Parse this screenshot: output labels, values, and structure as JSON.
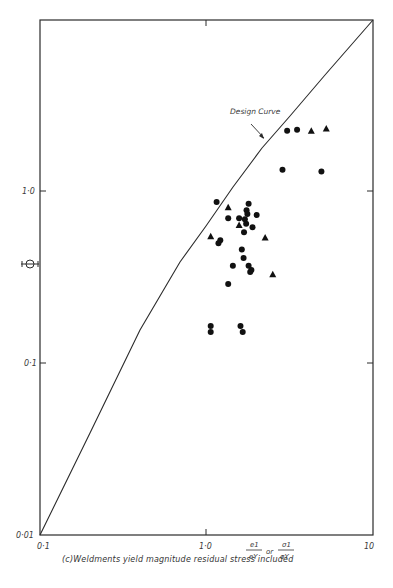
{
  "chart_data": {
    "type": "scatter",
    "title": "",
    "caption": "(c) Weldments yield magnitude residual stress included",
    "xlabel": "e1/eY or σ1/σY",
    "ylabel": "Φ",
    "xscale": "log",
    "yscale": "log",
    "xlim": [
      0.1,
      10
    ],
    "ylim": [
      0.01,
      10
    ],
    "x_ticks": [
      "0·1",
      "1·0",
      "10"
    ],
    "y_ticks": [
      "0·01",
      "0·1",
      "1·0"
    ],
    "grid": false,
    "annotations": [
      {
        "text": "Design Curve",
        "arrow_to": [
          1.72,
          1.7
        ]
      }
    ],
    "series": [
      {
        "name": "Design Curve",
        "kind": "line",
        "points": [
          [
            0.1,
            0.01
          ],
          [
            0.2,
            0.04
          ],
          [
            0.4,
            0.16
          ],
          [
            0.7,
            0.42
          ],
          [
            1.0,
            0.72
          ],
          [
            1.5,
            1.25
          ],
          [
            2.0,
            1.9
          ],
          [
            3.0,
            3.0
          ],
          [
            5.0,
            5.5
          ],
          [
            10,
            10
          ]
        ]
      },
      {
        "name": "circle-markers",
        "kind": "scatter",
        "marker": "circle",
        "points": [
          [
            3.05,
            2.26
          ],
          [
            3.5,
            2.29
          ],
          [
            2.86,
            1.34
          ],
          [
            4.9,
            1.31
          ],
          [
            1.15,
            0.87
          ],
          [
            1.35,
            0.7
          ],
          [
            1.57,
            0.7
          ],
          [
            1.74,
            0.78
          ],
          [
            1.79,
            0.85
          ],
          [
            1.76,
            0.74
          ],
          [
            1.7,
            0.69
          ],
          [
            1.89,
            0.62
          ],
          [
            1.73,
            0.65
          ],
          [
            1.68,
            0.58
          ],
          [
            2.0,
            0.73
          ],
          [
            1.18,
            0.5
          ],
          [
            1.21,
            0.52
          ],
          [
            1.63,
            0.46
          ],
          [
            1.67,
            0.41
          ],
          [
            1.79,
            0.37
          ],
          [
            1.44,
            0.37
          ],
          [
            1.35,
            0.29
          ],
          [
            1.86,
            0.35
          ],
          [
            1.83,
            0.34
          ],
          [
            1.06,
            0.165
          ],
          [
            1.06,
            0.152
          ],
          [
            1.6,
            0.165
          ],
          [
            1.65,
            0.152
          ]
        ]
      },
      {
        "name": "triangle-markers",
        "kind": "scatter",
        "marker": "triangle",
        "points": [
          [
            4.26,
            2.26
          ],
          [
            5.24,
            2.33
          ],
          [
            1.35,
            0.81
          ],
          [
            1.57,
            0.64
          ],
          [
            1.06,
            0.55
          ],
          [
            2.25,
            0.54
          ],
          [
            2.5,
            0.33
          ]
        ]
      }
    ]
  },
  "labels": {
    "design_curve": "Design Curve",
    "y_symbol": "Φ",
    "x_tick_0": "0·1",
    "x_tick_1": "1·0",
    "x_tick_2": "10",
    "y_tick_0": "0·01",
    "y_tick_1": "0·1",
    "y_tick_2": "1·0",
    "xlabel_num1": "e1",
    "xlabel_den1": "eY",
    "xlabel_or": "or",
    "xlabel_num2": "σ1",
    "xlabel_den2": "σY",
    "caption": "(c)Weldments yield magnitude residual stress included"
  }
}
